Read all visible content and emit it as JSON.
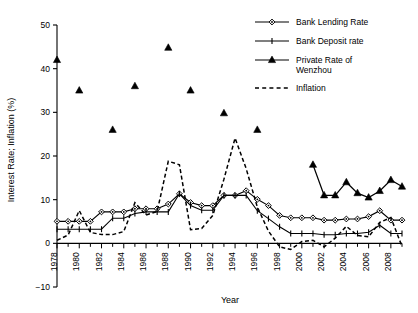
{
  "chart_data": {
    "type": "line",
    "title": "",
    "xlabel": "Year",
    "ylabel": "Interest Rate; Inflation (%)",
    "xlim": [
      1978,
      2009
    ],
    "ylim": [
      -10,
      50
    ],
    "ytick_values": [
      -10,
      0,
      10,
      20,
      30,
      40,
      50
    ],
    "ytick_labels": [
      "−10",
      "0",
      "10",
      "20",
      "30",
      "40",
      "50"
    ],
    "xtick_values": [
      1978,
      1980,
      1982,
      1984,
      1986,
      1988,
      1990,
      1992,
      1994,
      1996,
      1998,
      2000,
      2002,
      2004,
      2006,
      2008
    ],
    "xtick_labels": [
      "1978",
      "1980",
      "1982",
      "1984",
      "1986",
      "1988",
      "1990",
      "1992",
      "1994",
      "1996",
      "1998",
      "2000",
      "2002",
      "2004",
      "2006",
      "2008"
    ],
    "minor_xticks_every": 1,
    "grid": false,
    "legend_position": "top-right",
    "series": [
      {
        "name": "Bank Lending Rate",
        "marker": "diamond",
        "line": "solid",
        "color": "#000000",
        "x": [
          1978,
          1979,
          1980,
          1981,
          1982,
          1983,
          1984,
          1985,
          1986,
          1987,
          1988,
          1989,
          1990,
          1991,
          1992,
          1993,
          1994,
          1995,
          1996,
          1997,
          1998,
          1999,
          2000,
          2001,
          2002,
          2003,
          2004,
          2005,
          2006,
          2007,
          2008,
          2009
        ],
        "values": [
          5.04,
          5.04,
          5.04,
          5.04,
          7.2,
          7.2,
          7.2,
          7.92,
          7.92,
          7.92,
          9.0,
          11.34,
          9.36,
          8.64,
          8.64,
          10.98,
          10.98,
          12.06,
          10.08,
          8.64,
          6.39,
          5.85,
          5.85,
          5.85,
          5.31,
          5.31,
          5.58,
          5.58,
          6.12,
          7.47,
          5.31,
          5.31
        ]
      },
      {
        "name": "Bank Deposit rate",
        "marker": "plus",
        "line": "solid",
        "color": "#000000",
        "x": [
          1978,
          1979,
          1980,
          1981,
          1982,
          1983,
          1984,
          1985,
          1986,
          1987,
          1988,
          1989,
          1990,
          1991,
          1992,
          1993,
          1994,
          1995,
          1996,
          1997,
          1998,
          1999,
          2000,
          2001,
          2002,
          2003,
          2004,
          2005,
          2006,
          2007,
          2008,
          2009
        ],
        "values": [
          3.24,
          3.24,
          3.24,
          3.24,
          3.24,
          5.76,
          5.76,
          6.84,
          7.2,
          7.2,
          7.2,
          11.34,
          8.64,
          7.56,
          7.56,
          10.98,
          10.98,
          10.98,
          7.47,
          5.67,
          3.78,
          2.25,
          2.25,
          2.25,
          1.98,
          1.98,
          2.25,
          2.25,
          2.52,
          4.14,
          2.25,
          2.25
        ]
      },
      {
        "name": "Private Rate of Wenzhou",
        "marker": "triangle",
        "line": "solid-from-2001",
        "color": "#000000",
        "x": [
          1978,
          1980,
          1983,
          1985,
          1988,
          1990,
          1993,
          1996,
          2001,
          2002,
          2003,
          2004,
          2005,
          2006,
          2007,
          2008,
          2009
        ],
        "values": [
          42.0,
          35.0,
          26.0,
          36.0,
          44.8,
          35.0,
          29.8,
          26.0,
          18.0,
          11.0,
          11.0,
          14.0,
          11.5,
          10.5,
          12.0,
          14.5,
          13.0
        ]
      },
      {
        "name": "Inflation",
        "marker": "none",
        "line": "dashed",
        "color": "#000000",
        "x": [
          1978,
          1979,
          1980,
          1981,
          1982,
          1983,
          1984,
          1985,
          1986,
          1987,
          1988,
          1989,
          1990,
          1991,
          1992,
          1993,
          1994,
          1995,
          1996,
          1997,
          1998,
          1999,
          2000,
          2001,
          2002,
          2003,
          2004,
          2005,
          2006,
          2007,
          2008,
          2009
        ],
        "values": [
          0.7,
          1.9,
          7.5,
          2.5,
          2.0,
          2.0,
          2.7,
          9.3,
          6.5,
          7.3,
          18.8,
          18.0,
          3.1,
          3.4,
          6.4,
          14.7,
          24.1,
          17.1,
          8.3,
          2.8,
          -0.8,
          -1.4,
          0.4,
          0.7,
          -0.8,
          1.2,
          3.9,
          1.8,
          1.5,
          4.8,
          5.9,
          -0.7
        ]
      }
    ],
    "legend": [
      {
        "label": "Bank Lending Rate",
        "marker": "diamond",
        "line": "solid"
      },
      {
        "label": "Bank Deposit rate",
        "marker": "plus",
        "line": "solid"
      },
      {
        "label": "Private Rate of Wenzhou",
        "marker": "triangle",
        "line": "solid"
      },
      {
        "label": "Inflation",
        "marker": "none",
        "line": "dashed"
      }
    ]
  }
}
